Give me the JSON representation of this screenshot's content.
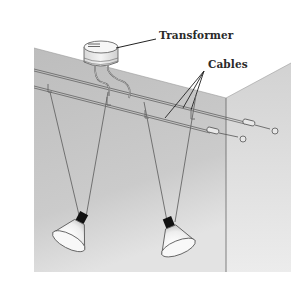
{
  "diagram": {
    "type": "labeled-illustration",
    "labels": [
      {
        "id": "transformer",
        "text": "Transformer"
      },
      {
        "id": "cables",
        "text": "Cables"
      }
    ],
    "components": [
      {
        "name": "transformer",
        "count": 1,
        "mount": "ceiling"
      },
      {
        "name": "cable",
        "count": 2,
        "mount": "wall-to-wall tensioned"
      },
      {
        "name": "spot-lamp",
        "count": 2,
        "mount": "suspended from cables"
      },
      {
        "name": "turnbuckle-anchor",
        "count": 2,
        "mount": "right wall"
      }
    ],
    "colors": {
      "background": "#ffffff",
      "left_wall": "#c4c4c4",
      "right_wall": "#dcdcdc",
      "ceiling": "#f7f7f7",
      "line": "#555555",
      "lamp_socket": "#111111",
      "label_text": "#2a2a2a"
    }
  }
}
